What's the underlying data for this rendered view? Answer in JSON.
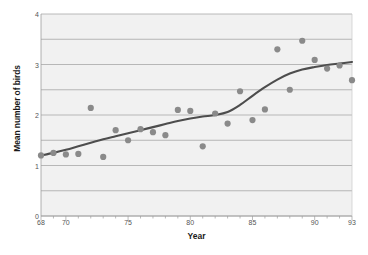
{
  "chart_data": {
    "type": "scatter",
    "title": "",
    "xlabel": "Year",
    "ylabel": "Mean number of birds",
    "xlim": [
      68,
      93
    ],
    "ylim": [
      0,
      4
    ],
    "grid": true,
    "legend": false,
    "x_tick_labels": [
      "68",
      "70",
      "75",
      "80",
      "85",
      "90",
      "93"
    ],
    "x_tick_values": [
      68,
      70,
      75,
      80,
      85,
      90,
      93
    ],
    "x_minor_ticks_every": 1,
    "y_tick_labels": [
      "0",
      "1",
      "2",
      "3",
      "4"
    ],
    "y_tick_values": [
      0,
      1,
      2,
      3,
      4
    ],
    "y_gridline_values": [
      0,
      0.5,
      1,
      1.5,
      2,
      2.5,
      3,
      3.5,
      4
    ],
    "marker_color": "#8a8a8a",
    "line_color": "#4d4d4d",
    "plot_background": "#f1f1f1",
    "gridline_color": "#9e9e9e",
    "series": [
      {
        "name": "Mean number of birds",
        "type": "scatter",
        "x": [
          68,
          69,
          70,
          71,
          72,
          73,
          74,
          75,
          76,
          77,
          78,
          79,
          80,
          81,
          82,
          83,
          84,
          85,
          86,
          87,
          88,
          89,
          90,
          91,
          92,
          93
        ],
        "y": [
          1.2,
          1.25,
          1.22,
          1.23,
          2.14,
          1.17,
          1.7,
          1.5,
          1.72,
          1.66,
          1.6,
          2.1,
          2.08,
          1.38,
          2.03,
          1.83,
          2.47,
          1.9,
          2.11,
          3.3,
          2.5,
          3.47,
          3.09,
          2.92,
          2.98,
          2.69
        ]
      },
      {
        "name": "Smoothed trend",
        "type": "line",
        "x": [
          68,
          69,
          70,
          71,
          72,
          73,
          74,
          75,
          76,
          77,
          78,
          79,
          80,
          81,
          82,
          83,
          84,
          85,
          86,
          87,
          88,
          89,
          90,
          91,
          92,
          93
        ],
        "y": [
          1.2,
          1.25,
          1.31,
          1.38,
          1.45,
          1.52,
          1.58,
          1.64,
          1.7,
          1.76,
          1.82,
          1.88,
          1.93,
          1.97,
          2.0,
          2.06,
          2.2,
          2.38,
          2.55,
          2.7,
          2.82,
          2.9,
          2.95,
          2.99,
          3.02,
          3.05
        ]
      }
    ]
  }
}
